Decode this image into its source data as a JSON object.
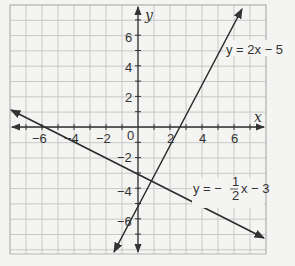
{
  "chart_data": {
    "type": "line",
    "title": "",
    "xlabel": "x",
    "ylabel": "y",
    "xlim": [
      -8,
      8
    ],
    "ylim": [
      -8,
      8
    ],
    "grid": true,
    "x_ticks": [
      -6,
      -4,
      -2,
      0,
      2,
      4,
      6
    ],
    "y_ticks": [
      -6,
      -4,
      -2,
      2,
      4,
      6
    ],
    "series": [
      {
        "name": "y = 2x - 5",
        "slope": 2,
        "intercept": -5,
        "points": [
          [
            -1.5,
            -8
          ],
          [
            6.5,
            8
          ]
        ]
      },
      {
        "name": "y = -1/2 x - 3",
        "slope": -0.5,
        "intercept": -3,
        "points": [
          [
            -8,
            1
          ],
          [
            8,
            -7
          ]
        ]
      }
    ],
    "intersection": [
      0.8,
      -3.4
    ]
  },
  "labels": {
    "x_axis": "x",
    "y_axis": "y",
    "origin": "0",
    "eq1": "y = 2x − 5",
    "eq2_prefix": "y = −",
    "eq2_num": "1",
    "eq2_den": "2",
    "eq2_suffix": "x − 3",
    "xt": [
      "−6",
      "−4",
      "−2",
      "2",
      "4",
      "6"
    ],
    "yt": [
      "6",
      "4",
      "2",
      "−2",
      "−4",
      "−6"
    ]
  }
}
